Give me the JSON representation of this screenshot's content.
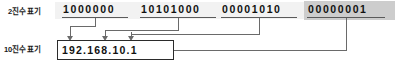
{
  "diagram": {
    "rows": {
      "binary_label": "2진수 표기",
      "decimal_label": "10진수 표기"
    },
    "binary_octets": [
      {
        "bits": "1000000",
        "decimal": "192",
        "highlighted": false
      },
      {
        "bits": "10101000",
        "decimal": "168",
        "highlighted": false
      },
      {
        "bits": "00001010",
        "decimal": "10",
        "highlighted": false
      },
      {
        "bits": "00000001",
        "decimal": "1",
        "highlighted": true
      }
    ],
    "decimal_value": "192.168.10.1",
    "colors": {
      "text": "#111111",
      "band": "#f2f2f2",
      "highlight": "#cdcdcd",
      "line": "#6a6a6a",
      "box_border": "#2b2b2b",
      "background": "#ffffff"
    }
  }
}
